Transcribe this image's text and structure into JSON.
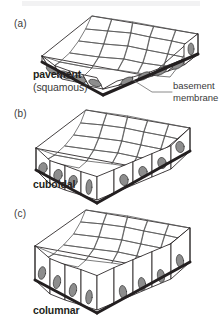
{
  "figure": {
    "background_color": "#ffffff",
    "ink_color": "#231f20",
    "nucleus_fill": "#8d8d8d",
    "membrane_color": "#231f20",
    "top_band_color": "#f2f2f3"
  },
  "panels": [
    {
      "letter": "(a)",
      "name": "pavement",
      "subtitle": "(squamous)",
      "cell_shape": "flat thin slab",
      "side_cells": 6,
      "nuclei": 6,
      "nucleus_shape": "flattened ellipse"
    },
    {
      "letter": "(b)",
      "name": "cuboidal",
      "subtitle": "",
      "cell_shape": "cube-like blocks",
      "side_cells": 6,
      "nuclei": 6,
      "nucleus_shape": "round oval"
    },
    {
      "letter": "(c)",
      "name": "columnar",
      "subtitle": "",
      "cell_shape": "tall columns",
      "side_cells": 6,
      "nuclei": 6,
      "nucleus_shape": "elongated oval"
    }
  ],
  "annotations": [
    {
      "id": "basement-membrane",
      "line1": "basement",
      "line2": "membrane",
      "points_to": "dark lower edge of slab (a)"
    }
  ]
}
